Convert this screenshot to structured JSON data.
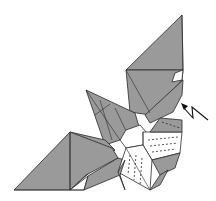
{
  "diagram": {
    "colors": {
      "paper_colored": "#9a9a9a",
      "paper_white": "#ffffff",
      "line": "#2a2a2a"
    },
    "symbols": [
      {
        "name": "open-sink-arrow",
        "type": "zigzag arrow",
        "position": "right of model, pointing up-left"
      }
    ],
    "regions": [
      {
        "name": "upper-flap",
        "color": "gray"
      },
      {
        "name": "left-flap",
        "color": "gray"
      },
      {
        "name": "left-middle-flap",
        "color": "gray"
      },
      {
        "name": "center-square",
        "color": "white",
        "marks": "dashed lines"
      }
    ]
  }
}
